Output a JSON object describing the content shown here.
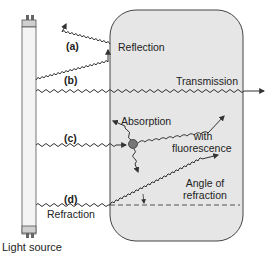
{
  "labels": {
    "a": "(a)",
    "b": "(b)",
    "c": "(c)",
    "d": "(d)",
    "reflection": "Reflection",
    "transmission": "Transmission",
    "absorption": "Absorption",
    "with": "with",
    "fluorescence": "fluorescence",
    "angle_of": "Angle of",
    "refraction_angle": "refraction",
    "refraction": "Refraction",
    "light_source": "Light source"
  },
  "colors": {
    "medium_fill": "#e6e6e6",
    "medium_stroke": "#444444",
    "tube_fill": "#f2f2f2",
    "wave": "#333333",
    "particle": "#777777"
  }
}
